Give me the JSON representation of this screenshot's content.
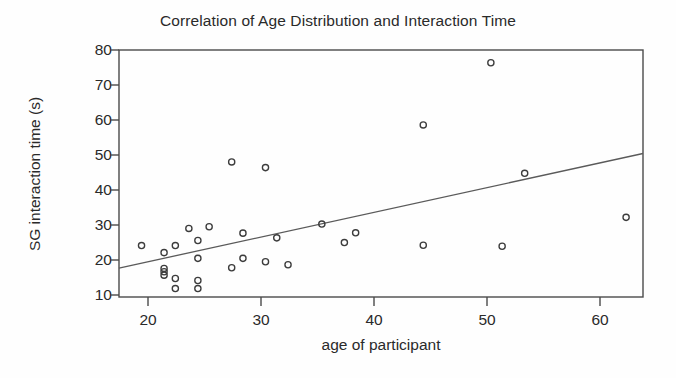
{
  "chart_data": {
    "type": "scatter",
    "title": "Correlation of Age Distribution and Interaction Time",
    "xlabel": "age of participant",
    "ylabel": "SG interaction time (s)",
    "xlim": [
      17,
      63.5
    ],
    "ylim": [
      7.5,
      81
    ],
    "grid": false,
    "legend": null,
    "xticks": [
      20,
      30,
      40,
      50,
      60
    ],
    "xtick_labels": [
      "20",
      "30",
      "40",
      "50",
      "60"
    ],
    "yticks": [
      10,
      20,
      30,
      40,
      50,
      60,
      70,
      80
    ],
    "ytick_labels": [
      "10",
      "20",
      "30",
      "40",
      "50",
      "60",
      "70",
      "80"
    ],
    "marker": "open-circle",
    "marker_color": "#3c3c3c",
    "points": [
      {
        "x": 19.0,
        "y": 22.8
      },
      {
        "x": 21.0,
        "y": 20.7
      },
      {
        "x": 21.0,
        "y": 16.0
      },
      {
        "x": 21.0,
        "y": 15.0
      },
      {
        "x": 21.0,
        "y": 14.0
      },
      {
        "x": 22.0,
        "y": 22.8
      },
      {
        "x": 22.0,
        "y": 13.0
      },
      {
        "x": 22.0,
        "y": 10.0
      },
      {
        "x": 23.2,
        "y": 27.9
      },
      {
        "x": 24.0,
        "y": 24.3
      },
      {
        "x": 24.0,
        "y": 19.0
      },
      {
        "x": 24.0,
        "y": 12.4
      },
      {
        "x": 24.0,
        "y": 10.0
      },
      {
        "x": 25.0,
        "y": 28.4
      },
      {
        "x": 27.0,
        "y": 47.7
      },
      {
        "x": 27.0,
        "y": 16.2
      },
      {
        "x": 28.0,
        "y": 26.5
      },
      {
        "x": 28.0,
        "y": 19.0
      },
      {
        "x": 30.0,
        "y": 46.0
      },
      {
        "x": 30.0,
        "y": 18.0
      },
      {
        "x": 31.0,
        "y": 25.1
      },
      {
        "x": 32.0,
        "y": 17.1
      },
      {
        "x": 35.0,
        "y": 29.2
      },
      {
        "x": 37.0,
        "y": 23.7
      },
      {
        "x": 38.0,
        "y": 26.6
      },
      {
        "x": 44.0,
        "y": 58.7
      },
      {
        "x": 44.0,
        "y": 22.9
      },
      {
        "x": 50.0,
        "y": 77.2
      },
      {
        "x": 51.0,
        "y": 22.6
      },
      {
        "x": 53.0,
        "y": 44.3
      },
      {
        "x": 62.0,
        "y": 31.2
      }
    ],
    "trendline": {
      "name": "linear fit",
      "x_start": 17.0,
      "y_start": 16.1,
      "x_end": 63.5,
      "y_end": 50.2,
      "color": "#5a5a5a"
    }
  }
}
